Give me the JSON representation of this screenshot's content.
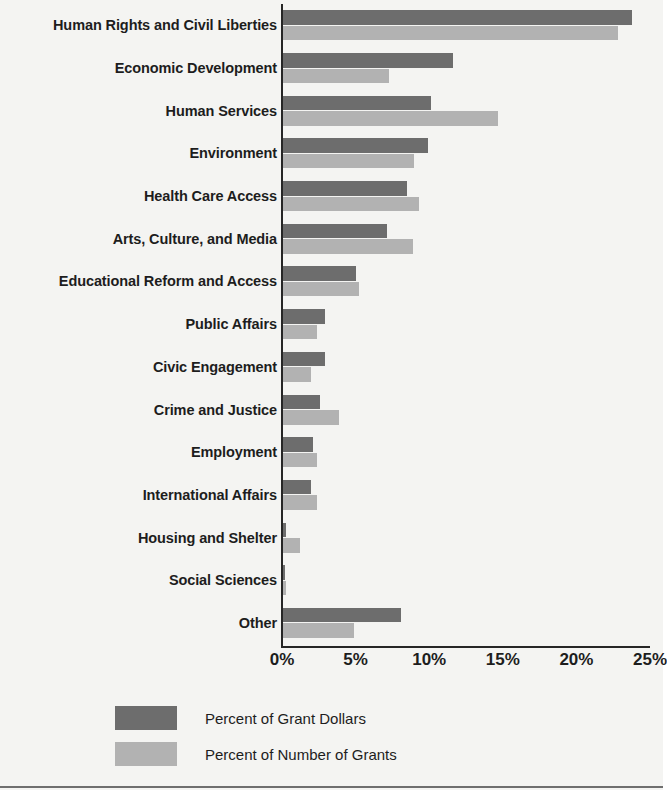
{
  "chart_data": {
    "type": "bar",
    "orientation": "horizontal",
    "title": "",
    "xlabel": "",
    "ylabel": "",
    "xlim": [
      0,
      25
    ],
    "xticks": [
      "0%",
      "5%",
      "10%",
      "15%",
      "20%",
      "25%"
    ],
    "xtick_values": [
      0,
      5,
      10,
      15,
      20,
      25
    ],
    "grid": false,
    "legend_position": "bottom-left",
    "categories": [
      "Human Rights and Civil Liberties",
      "Economic Development",
      "Human Services",
      "Environment",
      "Health Care Access",
      "Arts, Culture, and Media",
      "Educational Reform and Access",
      "Public Affairs",
      "Civic Engagement",
      "Crime and Justice",
      "Employment",
      "International Affairs",
      "Housing and Shelter",
      "Social Sciences",
      "Other"
    ],
    "series": [
      {
        "name": "Percent of Grant Dollars",
        "color": "#6d6d6d",
        "values": [
          23.8,
          11.6,
          10.1,
          9.9,
          8.5,
          7.1,
          5.0,
          2.9,
          2.9,
          2.6,
          2.1,
          2.0,
          0.3,
          0.2,
          8.1
        ]
      },
      {
        "name": "Percent of Number of Grants",
        "color": "#b2b2b2",
        "values": [
          22.8,
          7.3,
          14.7,
          9.0,
          9.3,
          8.9,
          5.2,
          2.4,
          2.0,
          3.9,
          2.4,
          2.4,
          1.2,
          0.3,
          4.9
        ]
      }
    ]
  },
  "legend": {
    "items": [
      {
        "label": "Percent of Grant Dollars",
        "color": "#6d6d6d"
      },
      {
        "label": "Percent of Number of Grants",
        "color": "#b2b2b2"
      }
    ]
  },
  "colors": {
    "dark_gray": "#6d6d6d",
    "light_gray": "#b2b2b2",
    "axis": "#262626",
    "text": "#1d1d1d",
    "background": "#f4f4f2"
  }
}
